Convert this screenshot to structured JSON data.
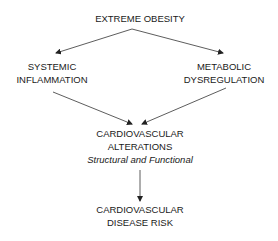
{
  "diagram": {
    "type": "flowchart",
    "nodes": {
      "top": {
        "lines": [
          "EXTREME OBESITY"
        ]
      },
      "left": {
        "lines": [
          "SYSTEMIC",
          "INFLAMMATION"
        ]
      },
      "right": {
        "lines": [
          "METABOLIC",
          "DYSREGULATION"
        ]
      },
      "middle": {
        "lines": [
          "CARDIOVASCULAR",
          "ALTERATIONS"
        ],
        "subtitle": "Structural and Functional"
      },
      "bottom": {
        "lines": [
          "CARDIOVASCULAR",
          "DISEASE RISK"
        ]
      }
    },
    "edges": [
      {
        "from": "EXTREME OBESITY",
        "to": "SYSTEMIC INFLAMMATION"
      },
      {
        "from": "EXTREME OBESITY",
        "to": "METABOLIC DYSREGULATION"
      },
      {
        "from": "SYSTEMIC INFLAMMATION",
        "to": "CARDIOVASCULAR ALTERATIONS"
      },
      {
        "from": "METABOLIC DYSREGULATION",
        "to": "CARDIOVASCULAR ALTERATIONS"
      },
      {
        "from": "CARDIOVASCULAR ALTERATIONS",
        "to": "CARDIOVASCULAR DISEASE RISK"
      }
    ],
    "colors": {
      "line": "#222222",
      "text": "#1a1a1a",
      "background": "#ffffff"
    }
  }
}
